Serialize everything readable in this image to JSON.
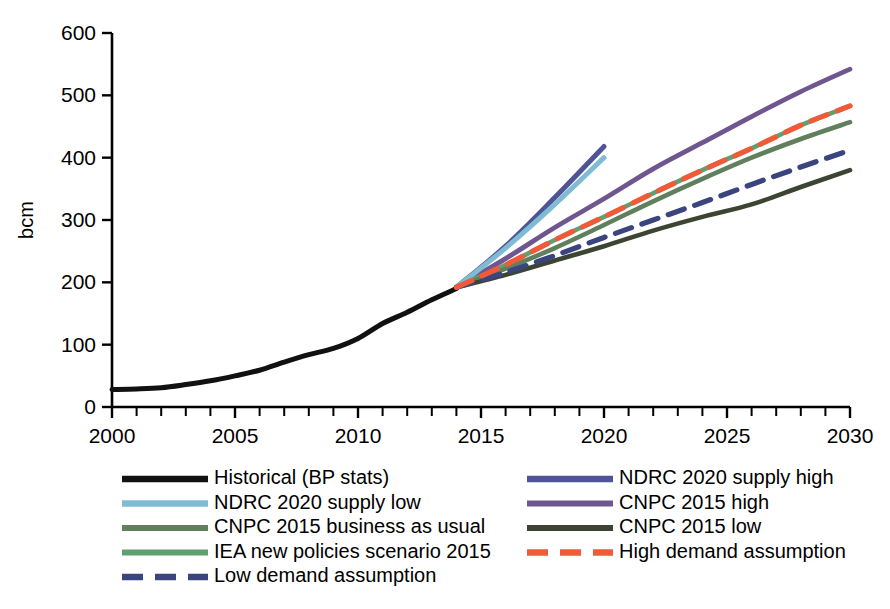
{
  "chart_data": {
    "type": "line",
    "title": "",
    "xlabel": "",
    "ylabel": "bcm",
    "xlim": [
      2000,
      2030
    ],
    "ylim": [
      0,
      600
    ],
    "grid": false,
    "legend_position": "below-plot, two columns",
    "y_ticks": [
      0,
      100,
      200,
      300,
      400,
      500,
      600
    ],
    "x_ticks": [
      2000,
      2005,
      2010,
      2015,
      2020,
      2025,
      2030
    ],
    "x_minor_tick_step": 1,
    "series": [
      {
        "name": "Historical (BP stats)",
        "color": "#111111",
        "style": "solid",
        "width": 5.0,
        "x": [
          2000,
          2001,
          2002,
          2003,
          2004,
          2005,
          2006,
          2007,
          2008,
          2009,
          2010,
          2011,
          2012,
          2013,
          2014
        ],
        "values": [
          28,
          29,
          31,
          36,
          42,
          50,
          59,
          72,
          84,
          94,
          110,
          134,
          152,
          172,
          190
        ]
      },
      {
        "name": "NDRC 2020 supply low",
        "color": "#7fbcd4",
        "style": "solid",
        "width": 5.0,
        "x": [
          2014,
          2016,
          2018,
          2020
        ],
        "values": [
          192,
          255,
          325,
          400
        ]
      },
      {
        "name": "CNPC 2015 business as usual",
        "color": "#5f7f5d",
        "style": "solid",
        "width": 4.6,
        "x": [
          2014,
          2016,
          2018,
          2020,
          2022,
          2024,
          2026,
          2028,
          2030
        ],
        "values": [
          192,
          222,
          255,
          292,
          330,
          366,
          400,
          430,
          457
        ]
      },
      {
        "name": "IEA new policies scenario 2015",
        "color": "#5fa070",
        "style": "solid",
        "width": 4.6,
        "x": [
          2014,
          2016,
          2018,
          2020,
          2022,
          2024,
          2026,
          2028,
          2030
        ],
        "values": [
          192,
          228,
          268,
          305,
          343,
          380,
          415,
          452,
          483
        ]
      },
      {
        "name": "Low demand assumption",
        "color": "#3a4580",
        "style": "dashed",
        "width": 5.2,
        "x": [
          2014,
          2016,
          2018,
          2020,
          2022,
          2024,
          2026,
          2028,
          2030
        ],
        "values": [
          192,
          216,
          243,
          272,
          300,
          328,
          357,
          385,
          412
        ]
      },
      {
        "name": "NDRC 2020 supply high",
        "color": "#4e5496",
        "style": "solid",
        "width": 5.0,
        "x": [
          2014,
          2016,
          2018,
          2020
        ],
        "values": [
          192,
          258,
          336,
          418
        ]
      },
      {
        "name": "CNPC 2015 high",
        "color": "#70568e",
        "style": "solid",
        "width": 4.8,
        "x": [
          2014,
          2016,
          2018,
          2020,
          2022,
          2024,
          2026,
          2028,
          2030
        ],
        "values": [
          192,
          238,
          288,
          334,
          382,
          424,
          466,
          506,
          542
        ]
      },
      {
        "name": "CNPC 2015 low",
        "color": "#3c4532",
        "style": "solid",
        "width": 4.6,
        "x": [
          2014,
          2016,
          2018,
          2020,
          2022,
          2024,
          2026,
          2028,
          2030
        ],
        "values": [
          192,
          212,
          235,
          258,
          283,
          305,
          325,
          353,
          380
        ]
      },
      {
        "name": "High demand assumption",
        "color": "#f15a38",
        "style": "dashed",
        "width": 5.2,
        "x": [
          2014,
          2016,
          2018,
          2020,
          2022,
          2024,
          2026,
          2028,
          2030
        ],
        "values": [
          192,
          228,
          268,
          305,
          343,
          380,
          415,
          452,
          483
        ]
      }
    ],
    "legend": {
      "column_left": [
        "Historical (BP stats)",
        "NDRC 2020 supply low",
        "CNPC 2015 business as usual",
        "IEA new policies scenario 2015",
        "Low demand assumption"
      ],
      "column_right": [
        "NDRC 2020 supply high",
        "CNPC 2015 high",
        "CNPC 2015 low",
        "High demand assumption"
      ]
    }
  }
}
